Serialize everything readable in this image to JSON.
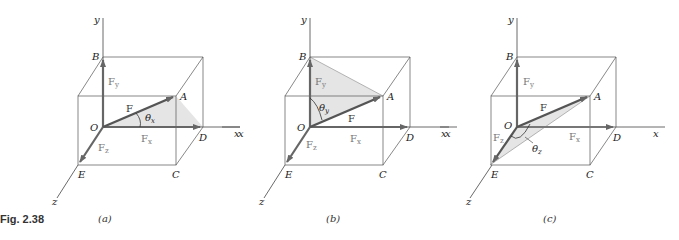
{
  "figure": {
    "label": "Fig. 2.38",
    "colors": {
      "arrow": "#666666",
      "box_line": "#555555",
      "axis_line": "#444444",
      "shade": "#d8d8d8"
    }
  },
  "panels": [
    {
      "caption": "(a)",
      "angle_label": "θ",
      "angle_sub": "x",
      "labels": {
        "y": "y",
        "x": "x",
        "z": "z",
        "O": "O",
        "A": "A",
        "B": "B",
        "C": "C",
        "D": "D",
        "E": "E"
      },
      "vectors": {
        "F": "F",
        "Fx": "F",
        "Fx_sub": "x",
        "Fy": "F",
        "Fy_sub": "y",
        "Fz": "F",
        "Fz_sub": "z"
      }
    },
    {
      "caption": "(b)",
      "angle_label": "θ",
      "angle_sub": "y",
      "labels": {
        "y": "y",
        "x": "x",
        "z": "z",
        "O": "O",
        "A": "A",
        "B": "B",
        "C": "C",
        "D": "D",
        "E": "E"
      },
      "vectors": {
        "F": "F",
        "Fx": "F",
        "Fx_sub": "x",
        "Fy": "F",
        "Fy_sub": "y",
        "Fz": "F",
        "Fz_sub": "z"
      }
    },
    {
      "caption": "(c)",
      "angle_label": "θ",
      "angle_sub": "z",
      "labels": {
        "y": "y",
        "x": "x",
        "z": "z",
        "O": "O",
        "A": "A",
        "B": "B",
        "C": "C",
        "D": "D",
        "E": "E"
      },
      "vectors": {
        "F": "F",
        "Fx": "F",
        "Fx_sub": "x",
        "Fy": "F",
        "Fy_sub": "y",
        "Fz": "F",
        "Fz_sub": "z"
      }
    }
  ]
}
